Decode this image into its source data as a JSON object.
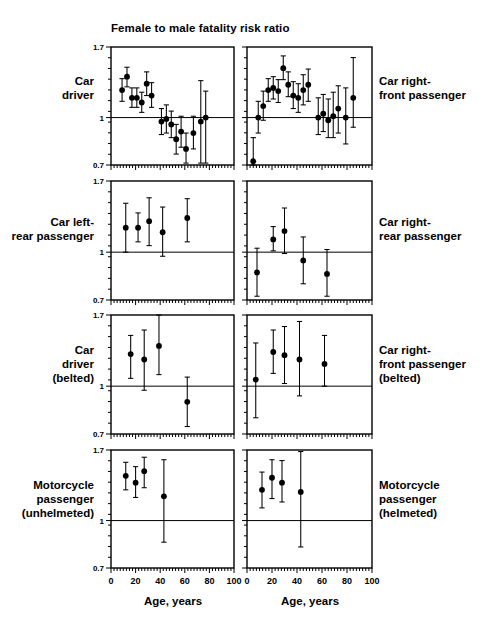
{
  "chart_data": {
    "type": "scatter",
    "title": "Female to male fatality risk ratio",
    "xlabel": "Age, years",
    "ylabel": "Female to male fatality risk ratio",
    "xlim": [
      0,
      100
    ],
    "ylim": [
      0.7,
      1.7
    ],
    "yscale": "log",
    "xticks": [
      0,
      20,
      40,
      60,
      80,
      100
    ],
    "xticklabels": [
      "0",
      "20",
      "40",
      "60",
      "80",
      "100"
    ],
    "yticks": [
      0.7,
      1,
      1.7
    ],
    "yticklabels": [
      "0.7",
      "1",
      "1.7"
    ],
    "grid": false,
    "legend": "none",
    "reference_line": 1,
    "error_bars": "95% confidence interval",
    "panel_layout": "4 rows x 2 columns",
    "panels": [
      {
        "row": 1,
        "col": 1,
        "label": "Car driver",
        "label_side": "left",
        "points": [
          {
            "x": 9,
            "y": 1.23,
            "lo": 1.13,
            "hi": 1.34
          },
          {
            "x": 13,
            "y": 1.36,
            "lo": 1.26,
            "hi": 1.46
          },
          {
            "x": 17,
            "y": 1.16,
            "lo": 1.08,
            "hi": 1.25
          },
          {
            "x": 21,
            "y": 1.16,
            "lo": 1.08,
            "hi": 1.25
          },
          {
            "x": 25,
            "y": 1.12,
            "lo": 1.04,
            "hi": 1.21
          },
          {
            "x": 29,
            "y": 1.29,
            "lo": 1.18,
            "hi": 1.41
          },
          {
            "x": 33,
            "y": 1.18,
            "lo": 1.08,
            "hi": 1.3
          },
          {
            "x": 41,
            "y": 0.97,
            "lo": 0.88,
            "hi": 1.07
          },
          {
            "x": 45,
            "y": 0.99,
            "lo": 0.89,
            "hi": 1.1
          },
          {
            "x": 49,
            "y": 0.95,
            "lo": 0.86,
            "hi": 1.05
          },
          {
            "x": 53,
            "y": 0.85,
            "lo": 0.76,
            "hi": 0.95
          },
          {
            "x": 57,
            "y": 0.9,
            "lo": 0.8,
            "hi": 1.01
          },
          {
            "x": 61,
            "y": 0.79,
            "lo": 0.71,
            "hi": 0.89
          },
          {
            "x": 67,
            "y": 0.89,
            "lo": 0.79,
            "hi": 1.01
          },
          {
            "x": 73,
            "y": 0.97,
            "lo": 0.71,
            "hi": 1.32
          },
          {
            "x": 77,
            "y": 1.0,
            "lo": 0.71,
            "hi": 1.22
          }
        ]
      },
      {
        "row": 1,
        "col": 2,
        "label": "Car right-front passenger",
        "label_side": "right",
        "points": [
          {
            "x": 5,
            "y": 0.72,
            "lo": 0.7,
            "hi": 0.86
          },
          {
            "x": 9,
            "y": 1.0,
            "lo": 0.89,
            "hi": 1.13
          },
          {
            "x": 13,
            "y": 1.09,
            "lo": 0.98,
            "hi": 1.22
          },
          {
            "x": 17,
            "y": 1.23,
            "lo": 1.13,
            "hi": 1.34
          },
          {
            "x": 21,
            "y": 1.25,
            "lo": 1.15,
            "hi": 1.36
          },
          {
            "x": 25,
            "y": 1.22,
            "lo": 1.12,
            "hi": 1.33
          },
          {
            "x": 29,
            "y": 1.45,
            "lo": 1.33,
            "hi": 1.59
          },
          {
            "x": 33,
            "y": 1.28,
            "lo": 1.17,
            "hi": 1.41
          },
          {
            "x": 37,
            "y": 1.18,
            "lo": 1.07,
            "hi": 1.31
          },
          {
            "x": 41,
            "y": 1.16,
            "lo": 1.04,
            "hi": 1.29
          },
          {
            "x": 45,
            "y": 1.23,
            "lo": 1.1,
            "hi": 1.38
          },
          {
            "x": 49,
            "y": 1.28,
            "lo": 1.13,
            "hi": 1.44
          },
          {
            "x": 57,
            "y": 1.0,
            "lo": 0.88,
            "hi": 1.16
          },
          {
            "x": 61,
            "y": 1.03,
            "lo": 0.9,
            "hi": 1.19
          },
          {
            "x": 65,
            "y": 0.98,
            "lo": 0.86,
            "hi": 1.15
          },
          {
            "x": 69,
            "y": 1.01,
            "lo": 0.86,
            "hi": 1.21
          },
          {
            "x": 73,
            "y": 1.07,
            "lo": 0.89,
            "hi": 1.27
          },
          {
            "x": 79,
            "y": 1.0,
            "lo": 0.82,
            "hi": 1.25
          },
          {
            "x": 85,
            "y": 1.16,
            "lo": 0.93,
            "hi": 1.57
          }
        ]
      },
      {
        "row": 2,
        "col": 1,
        "label": "Car left-rear passenger",
        "label_side": "left",
        "points": [
          {
            "x": 12,
            "y": 1.2,
            "lo": 1.0,
            "hi": 1.44
          },
          {
            "x": 22,
            "y": 1.2,
            "lo": 1.08,
            "hi": 1.34
          },
          {
            "x": 31,
            "y": 1.26,
            "lo": 1.05,
            "hi": 1.5
          },
          {
            "x": 42,
            "y": 1.16,
            "lo": 0.97,
            "hi": 1.4
          },
          {
            "x": 62,
            "y": 1.29,
            "lo": 1.08,
            "hi": 1.49
          }
        ]
      },
      {
        "row": 2,
        "col": 2,
        "label": "Car right-rear passenger",
        "label_side": "right",
        "points": [
          {
            "x": 8,
            "y": 0.86,
            "lo": 0.72,
            "hi": 1.03
          },
          {
            "x": 21,
            "y": 1.1,
            "lo": 1.01,
            "hi": 1.21
          },
          {
            "x": 30,
            "y": 1.17,
            "lo": 0.99,
            "hi": 1.39
          },
          {
            "x": 45,
            "y": 0.94,
            "lo": 0.79,
            "hi": 1.12
          },
          {
            "x": 64,
            "y": 0.85,
            "lo": 0.72,
            "hi": 1.02
          }
        ]
      },
      {
        "row": 3,
        "col": 1,
        "label": "Car driver (belted)",
        "label_side": "left",
        "points": [
          {
            "x": 16,
            "y": 1.27,
            "lo": 1.06,
            "hi": 1.46
          },
          {
            "x": 27,
            "y": 1.22,
            "lo": 0.97,
            "hi": 1.52
          },
          {
            "x": 39,
            "y": 1.35,
            "lo": 1.09,
            "hi": 1.7
          },
          {
            "x": 62,
            "y": 0.89,
            "lo": 0.74,
            "hi": 1.07
          }
        ]
      },
      {
        "row": 3,
        "col": 2,
        "label": "Car right-front passenger (belted)",
        "label_side": "right",
        "points": [
          {
            "x": 7,
            "y": 1.05,
            "lo": 0.79,
            "hi": 1.38
          },
          {
            "x": 21,
            "y": 1.29,
            "lo": 1.1,
            "hi": 1.52
          },
          {
            "x": 30,
            "y": 1.26,
            "lo": 1.02,
            "hi": 1.56
          },
          {
            "x": 42,
            "y": 1.22,
            "lo": 0.93,
            "hi": 1.62
          },
          {
            "x": 62,
            "y": 1.18,
            "lo": 1.0,
            "hi": 1.46
          }
        ]
      },
      {
        "row": 4,
        "col": 1,
        "label": "Motorcycle passenger (unhelmeted)",
        "label_side": "left",
        "points": [
          {
            "x": 12,
            "y": 1.4,
            "lo": 1.26,
            "hi": 1.55
          },
          {
            "x": 20,
            "y": 1.33,
            "lo": 1.19,
            "hi": 1.5
          },
          {
            "x": 27,
            "y": 1.45,
            "lo": 1.28,
            "hi": 1.61
          },
          {
            "x": 43,
            "y": 1.2,
            "lo": 0.85,
            "hi": 1.58
          }
        ]
      },
      {
        "row": 4,
        "col": 2,
        "label": "Motorcycle passenger (helmeted)",
        "label_side": "right",
        "points": [
          {
            "x": 12,
            "y": 1.26,
            "lo": 1.1,
            "hi": 1.44
          },
          {
            "x": 20,
            "y": 1.38,
            "lo": 1.18,
            "hi": 1.58
          },
          {
            "x": 28,
            "y": 1.33,
            "lo": 1.15,
            "hi": 1.57
          },
          {
            "x": 43,
            "y": 1.24,
            "lo": 0.82,
            "hi": 1.68
          }
        ]
      }
    ]
  },
  "labels": {
    "title": "Female to male fatality risk ratio",
    "x_axis_left": "Age, years",
    "x_axis_right": "Age, years",
    "row1_left": "Car\ndriver",
    "row1_right": "Car right-\nfront passenger",
    "row2_left": "Car left-\nrear passenger",
    "row2_right": "Car right-\nrear passenger",
    "row3_left": "Car\ndriver\n(belted)",
    "row3_right": "Car right-\nfront passenger\n(belted)",
    "row4_left": "Motorcycle\npassenger\n(unhelmeted)",
    "row4_right": "Motorcycle\npassenger\n(helmeted)"
  }
}
